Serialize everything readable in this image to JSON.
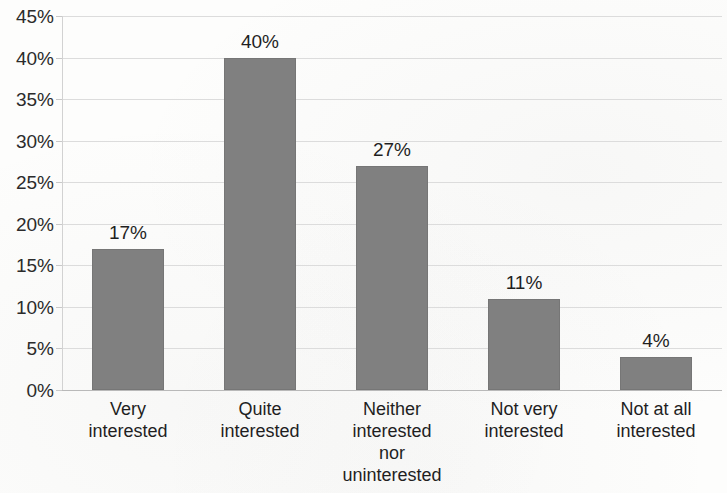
{
  "chart_data": {
    "type": "bar",
    "title": "",
    "subtitle": "",
    "xlabel": "",
    "ylabel": "",
    "categories": [
      "Very\ninterested",
      "Quite\ninterested",
      "Neither\ninterested\nnor\nuninterested",
      "Not very\ninterested",
      "Not at all\ninterested"
    ],
    "values": [
      17,
      40,
      27,
      11,
      4
    ],
    "data_labels": [
      "17%",
      "40%",
      "27%",
      "11%",
      "4%"
    ],
    "ylim": [
      0,
      45
    ],
    "ytick_step": 5,
    "ytick_labels": [
      "45%",
      "40%",
      "35%",
      "30%",
      "25%",
      "20%",
      "15%",
      "10%",
      "5%",
      "0%"
    ],
    "ytick_values": [
      45,
      40,
      35,
      30,
      25,
      20,
      15,
      10,
      5,
      0
    ],
    "grid": true,
    "legend": false,
    "legend_position": "none",
    "series_color": "#808080",
    "gridline_color": "#dcdcdc",
    "axis_color": "#b9b9b9",
    "text_color": "#1f1f1f",
    "background_color": "#fdfdfc"
  }
}
